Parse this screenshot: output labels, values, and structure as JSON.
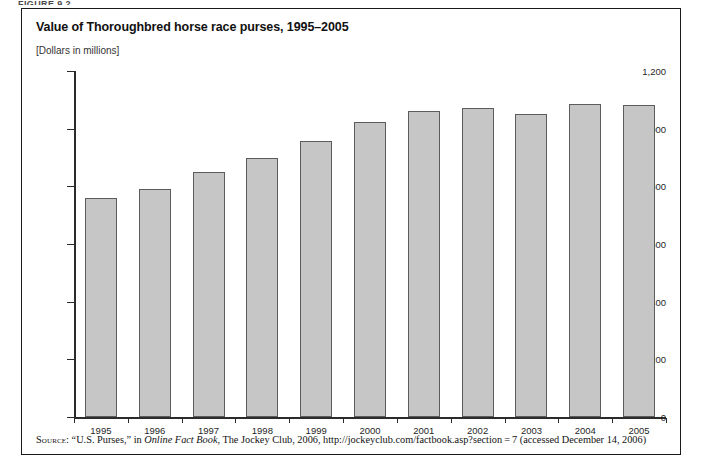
{
  "figure": {
    "cut_label": "FIGURE 9.2",
    "title": "Value of Thoroughbred horse race purses, 1995–2005",
    "units_note": "[Dollars in millions]"
  },
  "source": {
    "label": "Source:",
    "part1": " “U.S. Purses,” in ",
    "italic": "Online Fact Book",
    "part2": ", The Jockey Club, 2006, http://jockeyclub.com/factbook.asp?section = 7 (accessed December 14, 2006)"
  },
  "colors": {
    "bar_fill": "#c6c6c6",
    "bar_border": "#5c5c5c",
    "axis": "#2b2b2b",
    "frame": "#1a1a1a",
    "text": "#111111"
  },
  "chart_data": {
    "type": "bar",
    "title": "Value of Thoroughbred horse race purses, 1995–2005",
    "subtitle": "[Dollars in millions]",
    "xlabel": "",
    "ylabel": "",
    "ylim": [
      0,
      1200
    ],
    "yticks": [
      0,
      200,
      400,
      600,
      800,
      1000,
      1200
    ],
    "ytick_labels": [
      "0",
      "200",
      "400",
      "600",
      "800",
      "1,000",
      "1,200"
    ],
    "grid": false,
    "legend": false,
    "categories": [
      "1995",
      "1996",
      "1997",
      "1998",
      "1999",
      "2000",
      "2001",
      "2002",
      "2003",
      "2004",
      "2005"
    ],
    "values": [
      760,
      790,
      850,
      900,
      958,
      1023,
      1061,
      1072,
      1051,
      1086,
      1081
    ]
  }
}
